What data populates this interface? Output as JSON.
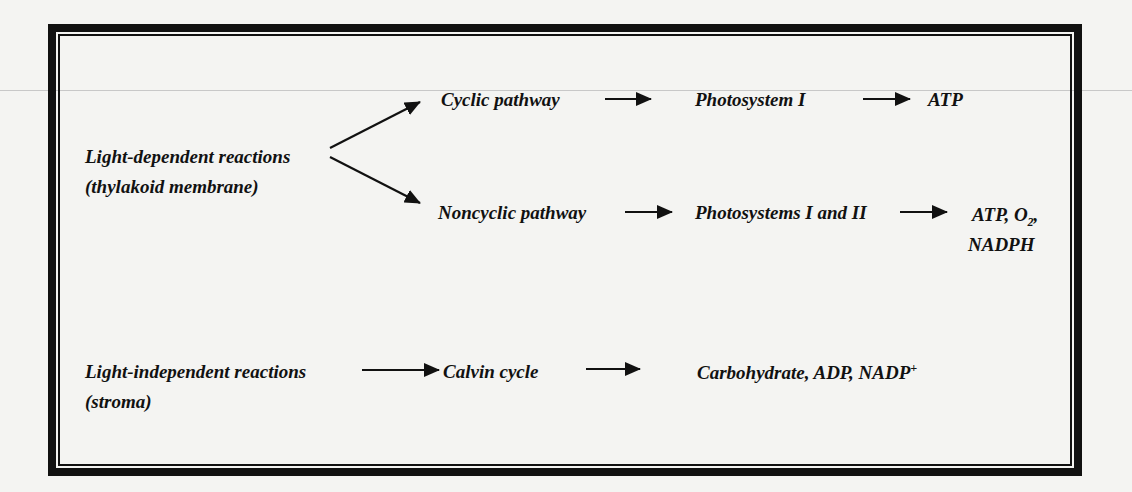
{
  "diagram": {
    "light_dependent": {
      "label": "Light-dependent reactions",
      "location": "(thylakoid membrane)",
      "cyclic": {
        "pathway": "Cyclic pathway",
        "system": "Photosystem I",
        "products": "ATP"
      },
      "noncyclic": {
        "pathway": "Noncyclic pathway",
        "system": "Photosystems I and II",
        "products_line1_prefix": "ATP, O",
        "products_line1_sub": "2",
        "products_line1_suffix": ",",
        "products_line2": "NADPH"
      }
    },
    "light_independent": {
      "label": "Light-independent reactions",
      "location": "(stroma)",
      "cycle": "Calvin cycle",
      "products_prefix": "Carbohydrate, ADP, NADP",
      "products_sup": "+"
    },
    "arrow_color": "#111111",
    "border_color": "#111111"
  }
}
